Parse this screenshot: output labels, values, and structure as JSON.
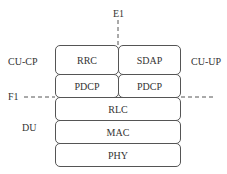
{
  "diagram": {
    "interfaces": {
      "e1": "E1",
      "f1": "F1"
    },
    "side_labels": {
      "cu_cp": "CU-CP",
      "cu_up": "CU-UP",
      "du": "DU"
    },
    "cu_cp_stack": [
      "RRC",
      "PDCP"
    ],
    "cu_up_stack": [
      "SDAP",
      "PDCP"
    ],
    "du_stack": [
      "RLC",
      "MAC",
      "PHY"
    ],
    "line_color": "#555555"
  }
}
